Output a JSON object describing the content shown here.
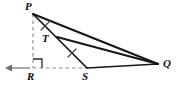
{
  "figure": {
    "name": "triangle-pqr-geometry-figure",
    "background_color": "#ffffff",
    "stroke_color": "#1a1a1a",
    "dashed_color": "#8c8c8c",
    "width": 180,
    "height": 89,
    "labels": [
      {
        "id": "P",
        "text": "P",
        "x": 25,
        "y": 1
      },
      {
        "id": "T",
        "text": "T",
        "x": 42,
        "y": 33
      },
      {
        "id": "R",
        "text": "R",
        "x": 27,
        "y": 71
      },
      {
        "id": "S",
        "text": "S",
        "x": 82,
        "y": 71
      },
      {
        "id": "Q",
        "text": "Q",
        "x": 163,
        "y": 58
      }
    ],
    "points": {
      "P": {
        "x": 33,
        "y": 14
      },
      "T": {
        "x": 58,
        "y": 38
      },
      "R": {
        "x": 33,
        "y": 68
      },
      "S": {
        "x": 87,
        "y": 68
      },
      "Q": {
        "x": 158,
        "y": 64
      }
    },
    "solid_segments": [
      {
        "id": "PQ",
        "from": "P",
        "to": "Q"
      },
      {
        "id": "PS",
        "from": "P",
        "to": "S"
      },
      {
        "id": "TQ",
        "from": "T",
        "to": "Q"
      },
      {
        "id": "SQ",
        "from": "S",
        "to": "Q"
      }
    ],
    "dashed_segments": [
      {
        "id": "PR",
        "from": "P",
        "to": "R"
      },
      {
        "id": "RS",
        "from": "R",
        "to": "S"
      }
    ],
    "tick_marks": [
      {
        "id": "tick-PT",
        "cx": 45,
        "cy": 26,
        "angle": -35
      },
      {
        "id": "tick-TS",
        "cx": 72,
        "cy": 53,
        "angle": -35
      }
    ],
    "right_angle": {
      "id": "right-angle-R",
      "x": 33,
      "y": 68,
      "size": 9
    },
    "arrow": {
      "id": "left-ray-arrow",
      "from_x": 30,
      "from_y": 68,
      "to_x": 6,
      "to_y": 68
    }
  }
}
